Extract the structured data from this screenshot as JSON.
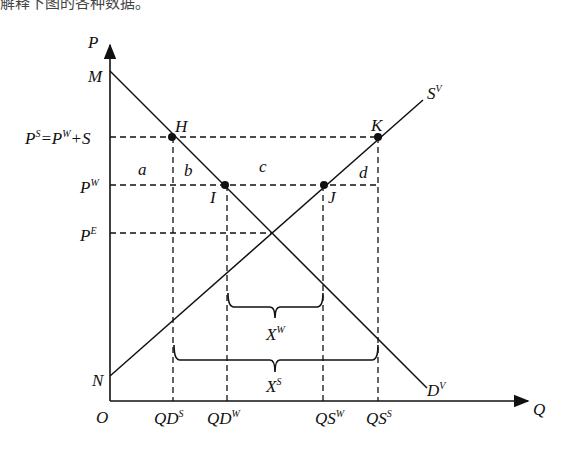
{
  "caption_fragment": "解释下图的各种数据。",
  "axes": {
    "y_label": "P",
    "x_label": "Q",
    "origin": "O"
  },
  "curves": {
    "demand": {
      "label": "D",
      "sup": "V"
    },
    "supply": {
      "label": "S",
      "sup": "V"
    }
  },
  "price_labels": {
    "subsidy": {
      "main": "P",
      "sup": "S",
      "eq": "=P",
      "sup2": "W",
      "tail": "+S"
    },
    "world": {
      "main": "P",
      "sup": "W"
    },
    "equilibrium": {
      "main": "P",
      "sup": "E"
    },
    "M": "M",
    "N": "N"
  },
  "points": {
    "H": "H",
    "I": "I",
    "J": "J",
    "K": "K"
  },
  "areas": {
    "a": "a",
    "b": "b",
    "c": "c",
    "d": "d"
  },
  "quantity_labels": [
    {
      "main": "QD",
      "sup": "S"
    },
    {
      "main": "QD",
      "sup": "W"
    },
    {
      "main": "QS",
      "sup": "W"
    },
    {
      "main": "QS",
      "sup": "S"
    }
  ],
  "braces": {
    "exports_world": {
      "main": "X",
      "sup": "W"
    },
    "exports_subsidy": {
      "main": "X",
      "sup": "S"
    }
  }
}
